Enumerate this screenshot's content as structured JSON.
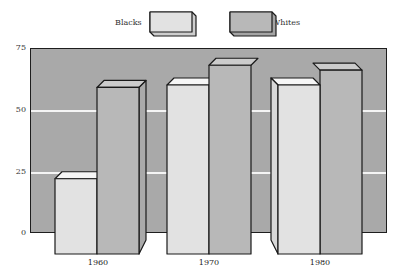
{
  "chart_data": {
    "type": "bar",
    "title": "",
    "xlabel": "",
    "ylabel": "",
    "categories": [
      "1960",
      "1970",
      "1980"
    ],
    "series": [
      {
        "name": "Blacks",
        "values": [
          22,
          60,
          60
        ],
        "color": "#e2e2e2"
      },
      {
        "name": "Whites",
        "values": [
          59,
          68,
          66
        ],
        "color": "#b8b8b8"
      }
    ],
    "ylim": [
      0,
      75
    ],
    "yticks": [
      "0",
      "25",
      "50",
      "75"
    ],
    "grid": true,
    "legend_position": "top",
    "style": "3d-bars",
    "plot_background": "#a9a9a9"
  },
  "legend": {
    "items": [
      {
        "label": "Blacks"
      },
      {
        "label": "Whites"
      }
    ]
  },
  "axis": {
    "y_ticks": [
      "75",
      "50",
      "25",
      "0"
    ],
    "x_labels": [
      "1960",
      "1970",
      "1980"
    ]
  }
}
